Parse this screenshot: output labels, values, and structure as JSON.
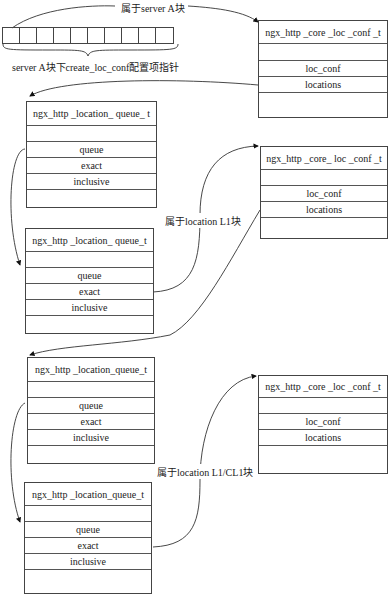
{
  "labels": {
    "belongs_server_a": "属于server A块",
    "array_caption": "server A块下create_loc_conf配置项指针",
    "belongs_l1": "属于location L1块",
    "belongs_l1_cl1": "属于location L1/CL1块"
  },
  "array": {
    "cell_count": 10
  },
  "core_loc_conf_boxes": [
    {
      "title": "ngx_http _core _loc _conf _t",
      "rows": [
        "",
        "loc_conf",
        "locations",
        ""
      ]
    },
    {
      "title": "ngx_http _core_ loc _conf _t",
      "rows": [
        "",
        "loc_conf",
        "locations",
        ""
      ]
    },
    {
      "title": "ngx_http _core _loc _conf _t",
      "rows": [
        "",
        "loc_conf",
        "locations",
        ""
      ]
    }
  ],
  "location_queue_boxes": [
    {
      "title": "ngx_http _location_ queue_ t",
      "rows": [
        "",
        "queue",
        "exact",
        "inclusive",
        ""
      ]
    },
    {
      "title": "ngx_http _location_ queue_t",
      "rows": [
        "",
        "queue",
        "exact",
        "inclusive",
        ""
      ]
    },
    {
      "title": "ngx_http _location_queue_t",
      "rows": [
        "",
        "queue",
        "exact",
        "inclusive",
        ""
      ]
    },
    {
      "title": "ngx_http _location_queue_t",
      "rows": [
        "",
        "queue",
        "exact",
        "inclusive",
        ""
      ]
    }
  ]
}
